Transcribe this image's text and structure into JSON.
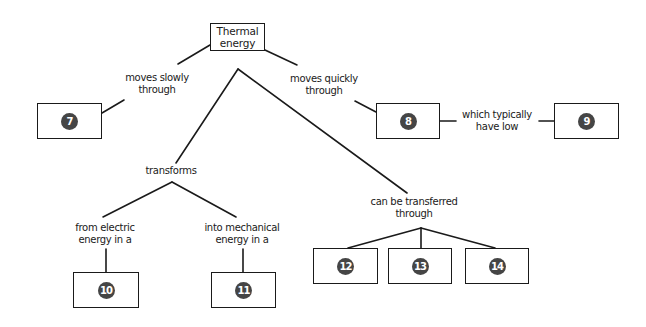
{
  "root": {
    "line1": "Thermal",
    "line2": "energy"
  },
  "links": {
    "slow": {
      "line1": "moves slowly",
      "line2": "through"
    },
    "quick": {
      "line1": "moves quickly",
      "line2": "through"
    },
    "low": {
      "line1": "which typically",
      "line2": "have low"
    },
    "transforms": {
      "line1": "transforms"
    },
    "from_electric": {
      "line1": "from electric",
      "line2": "energy in a"
    },
    "into_mechanical": {
      "line1": "into mechanical",
      "line2": "energy in a"
    },
    "transferred": {
      "line1": "can be transferred",
      "line2": "through"
    }
  },
  "blanks": [
    {
      "id": "7",
      "label": "7"
    },
    {
      "id": "8",
      "label": "8"
    },
    {
      "id": "9",
      "label": "9"
    },
    {
      "id": "10",
      "label": "10"
    },
    {
      "id": "11",
      "label": "11"
    },
    {
      "id": "12",
      "label": "12"
    },
    {
      "id": "13",
      "label": "13"
    },
    {
      "id": "14",
      "label": "14"
    }
  ],
  "colors": {
    "line": "#1a1a1a",
    "badge": "#454545",
    "badge_text": "#ffffff"
  }
}
